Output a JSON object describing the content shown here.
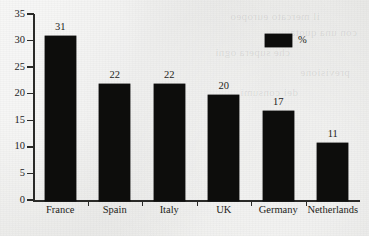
{
  "chart_data": {
    "type": "bar",
    "title": "",
    "subtitle": "",
    "xlabel": "",
    "ylabel": "",
    "categories": [
      "France",
      "Spain",
      "Italy",
      "UK",
      "Germany",
      "Netherlands"
    ],
    "values": [
      31,
      22,
      22,
      20,
      17,
      11
    ],
    "series": [
      {
        "name": "%",
        "values": [
          31,
          22,
          22,
          20,
          17,
          11
        ]
      }
    ],
    "data_labels": [
      "31",
      "22",
      "22",
      "20",
      "17",
      "11"
    ],
    "ylim": [
      0,
      35
    ],
    "ytick_values": [
      0,
      5,
      10,
      15,
      20,
      25,
      30,
      35
    ],
    "ytick_labels": [
      "0",
      "5",
      "10",
      "15",
      "20",
      "25",
      "30",
      "35"
    ],
    "grid": false,
    "legend": {
      "position": "top-right",
      "entries": [
        {
          "label": "%",
          "color": "#0d0d0c"
        }
      ]
    },
    "bar_color": "#0d0d0c",
    "background_color": "#e9e9e7",
    "axis_color": "#2a2a28"
  },
  "bleed_text": [
    "il mercato europeo",
    "con una quota",
    "che supera ogni",
    "previsione",
    "dei consumi"
  ]
}
